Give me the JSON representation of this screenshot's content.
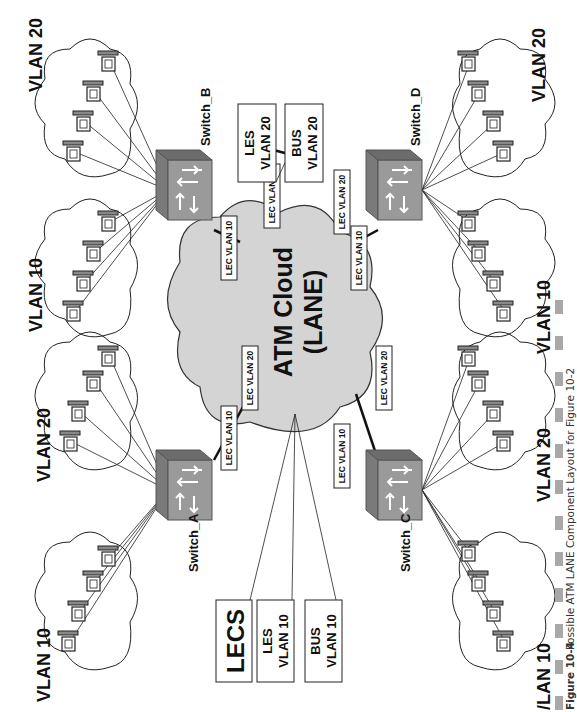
{
  "diagram": {
    "cloud": {
      "line1": "ATM Cloud",
      "line2": "(LANE)",
      "fill": "#d4d4d4"
    },
    "services": {
      "lecs": "LECS",
      "les10": {
        "l1": "LES",
        "l2": "VLAN 10"
      },
      "bus10": {
        "l1": "BUS",
        "l2": "VLAN 10"
      },
      "les20": {
        "l1": "LES",
        "l2": "VLAN 20"
      },
      "bus20": {
        "l1": "BUS",
        "l2": "VLAN 20"
      }
    },
    "switches": {
      "a": {
        "name": "Switch_A",
        "lec1": "LEC VLAN 10",
        "lec2": "LEC VLAN 20"
      },
      "b": {
        "name": "Switch_B",
        "lec1": "LEC VLAN 10",
        "lec2": "LEC VLAN 20"
      },
      "c": {
        "name": "Switch_C",
        "lec1": "LEC VLAN 10",
        "lec2": "LEC VLAN 20"
      },
      "d": {
        "name": "Switch_D",
        "lec1": "LEC VLAN 10",
        "lec2": "LEC VLAN 20"
      }
    },
    "vlans": {
      "a10": "VLAN 10",
      "a20": "VLAN 20",
      "b10": "VLAN 10",
      "b20": "VLAN 20",
      "c10": "/LAN 10",
      "c20": "VLAN 20",
      "d10": "VLAN 10",
      "d20": "VLAN 20"
    },
    "colors": {
      "switch_top": "#7a7a7a",
      "switch_front": "#9a9a9a",
      "switch_side": "#6c6c6c",
      "caption_bar": "#a8a8a8"
    }
  },
  "caption": {
    "figure": "Figure 10-4",
    "text": "Possible ATM LANE Component Layout for Figure 10-2"
  }
}
